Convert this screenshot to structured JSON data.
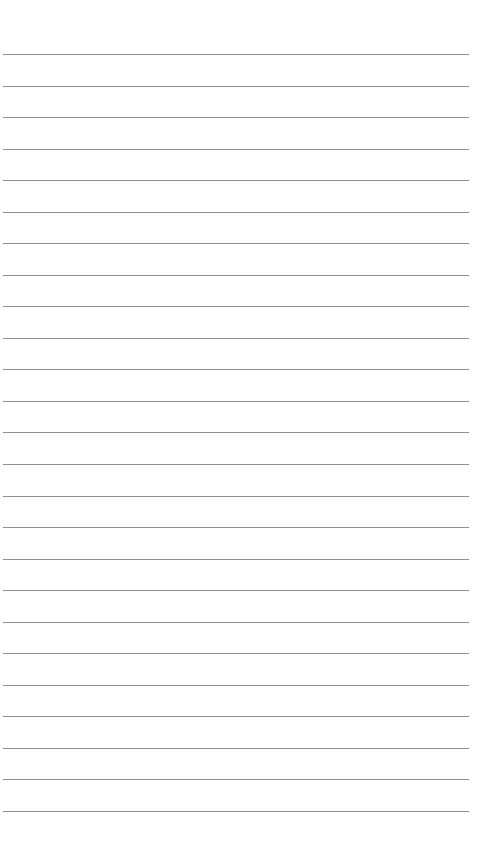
{
  "page": {
    "type": "lined-paper",
    "background_color": "#ffffff",
    "line_color": "#8f8f8f",
    "line_count": 25,
    "first_line_y": 54,
    "line_spacing": 31.54,
    "line_left": 3,
    "line_right": 469,
    "lines": []
  }
}
